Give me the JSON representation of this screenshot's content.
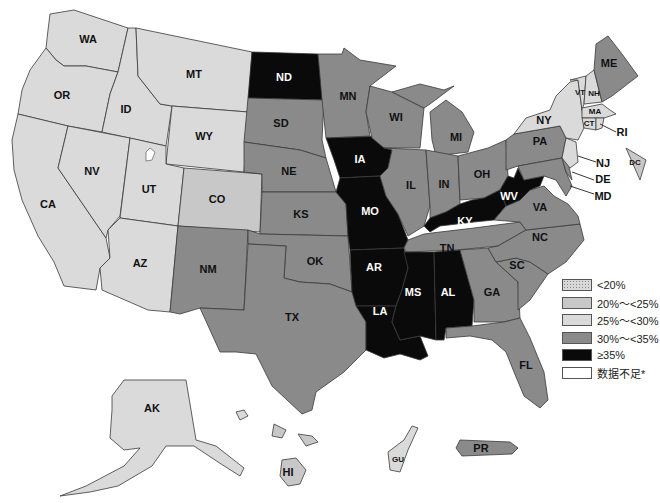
{
  "map": {
    "title": "",
    "colors": {
      "lt20": "#d8d8d8",
      "c20_25": "#c8c8c8",
      "c25_30": "#dadada",
      "c30_35": "#8a8a8a",
      "ge35": "#0a0a0a",
      "nodata": "#ffffff",
      "lake": "#ffffff"
    },
    "states": {
      "WA": {
        "label": "WA",
        "category": "25%~<30%"
      },
      "OR": {
        "label": "OR",
        "category": "25%~<30%"
      },
      "CA": {
        "label": "CA",
        "category": "25%~<30%"
      },
      "ID": {
        "label": "ID",
        "category": "25%~<30%"
      },
      "NV": {
        "label": "NV",
        "category": "25%~<30%"
      },
      "MT": {
        "label": "MT",
        "category": "25%~<30%"
      },
      "WY": {
        "label": "WY",
        "category": "25%~<30%"
      },
      "UT": {
        "label": "UT",
        "category": "25%~<30%"
      },
      "AZ": {
        "label": "AZ",
        "category": "25%~<30%"
      },
      "CO": {
        "label": "CO",
        "category": "20%~<25%"
      },
      "NM": {
        "label": "NM",
        "category": "30%~<35%"
      },
      "ND": {
        "label": "ND",
        "category": "≥35%"
      },
      "SD": {
        "label": "SD",
        "category": "30%~<35%"
      },
      "NE": {
        "label": "NE",
        "category": "30%~<35%"
      },
      "KS": {
        "label": "KS",
        "category": "30%~<35%"
      },
      "OK": {
        "label": "OK",
        "category": "30%~<35%"
      },
      "TX": {
        "label": "TX",
        "category": "30%~<35%"
      },
      "MN": {
        "label": "MN",
        "category": "30%~<35%"
      },
      "IA": {
        "label": "IA",
        "category": "≥35%"
      },
      "MO": {
        "label": "MO",
        "category": "≥35%"
      },
      "AR": {
        "label": "AR",
        "category": "≥35%"
      },
      "LA": {
        "label": "LA",
        "category": "≥35%"
      },
      "WI": {
        "label": "WI",
        "category": "30%~<35%"
      },
      "IL": {
        "label": "IL",
        "category": "30%~<35%"
      },
      "MI": {
        "label": "MI",
        "category": "30%~<35%"
      },
      "IN": {
        "label": "IN",
        "category": "30%~<35%"
      },
      "OH": {
        "label": "OH",
        "category": "30%~<35%"
      },
      "KY": {
        "label": "KY",
        "category": "≥35%"
      },
      "TN": {
        "label": "TN",
        "category": "30%~<35%"
      },
      "MS": {
        "label": "MS",
        "category": "≥35%"
      },
      "AL": {
        "label": "AL",
        "category": "≥35%"
      },
      "GA": {
        "label": "GA",
        "category": "30%~<35%"
      },
      "FL": {
        "label": "FL",
        "category": "30%~<35%"
      },
      "SC": {
        "label": "SC",
        "category": "30%~<35%"
      },
      "NC": {
        "label": "NC",
        "category": "30%~<35%"
      },
      "VA": {
        "label": "VA",
        "category": "30%~<35%"
      },
      "WV": {
        "label": "WV",
        "category": "≥35%"
      },
      "PA": {
        "label": "PA",
        "category": "30%~<35%"
      },
      "NY": {
        "label": "NY",
        "category": "25%~<30%"
      },
      "VT": {
        "label": "VT",
        "category": "25%~<30%"
      },
      "NH": {
        "label": "NH",
        "category": "25%~<30%"
      },
      "ME": {
        "label": "ME",
        "category": "30%~<35%"
      },
      "MA": {
        "label": "MA",
        "category": "25%~<30%"
      },
      "CT": {
        "label": "CT",
        "category": "25%~<30%"
      },
      "RI": {
        "label": "RI",
        "category": "25%~<30%"
      },
      "NJ": {
        "label": "NJ",
        "category": "25%~<30%"
      },
      "DE": {
        "label": "DE",
        "category": "30%~<35%"
      },
      "MD": {
        "label": "MD",
        "category": "30%~<35%"
      },
      "DC": {
        "label": "DC",
        "category": "20%~<25%"
      },
      "AK": {
        "label": "AK",
        "category": "25%~<30%"
      },
      "HI": {
        "label": "HI",
        "category": "20%~<25%"
      },
      "GU": {
        "label": "GU",
        "category": "25%~<30%"
      },
      "PR": {
        "label": "PR",
        "category": "30%~<35%"
      }
    }
  },
  "legend": {
    "items": [
      {
        "label": "<20%",
        "key": "lt20",
        "pattern": "dotted"
      },
      {
        "label": "20%～<25%",
        "key": "c20_25"
      },
      {
        "label": "25%～<30%",
        "key": "c25_30"
      },
      {
        "label": "30%～<35%",
        "key": "c30_35"
      },
      {
        "label": "≥35%",
        "key": "ge35"
      },
      {
        "label": "数据不足*",
        "key": "nodata"
      }
    ]
  }
}
